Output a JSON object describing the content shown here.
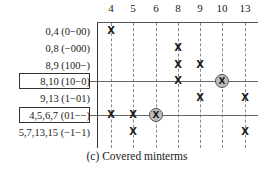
{
  "columns": [
    {
      "label": "4",
      "x": 111
    },
    {
      "label": "5",
      "x": 133
    },
    {
      "label": "6",
      "x": 156
    },
    {
      "label": "8",
      "x": 178
    },
    {
      "label": "9",
      "x": 200
    },
    {
      "label": "10",
      "x": 222
    },
    {
      "label": "13",
      "x": 245
    }
  ],
  "rows": [
    {
      "label": "0,4 (0−00)",
      "y": 31,
      "boxed": false
    },
    {
      "label": "0,8 (−000)",
      "y": 48,
      "boxed": false
    },
    {
      "label": "8,9 (100−)",
      "y": 65,
      "boxed": false
    },
    {
      "label": "8,10 (10−0)",
      "y": 81,
      "boxed": true
    },
    {
      "label": "9,13 (1−01)",
      "y": 98,
      "boxed": false
    },
    {
      "label": "4,5,6,7 (01−−)",
      "y": 115,
      "boxed": true
    },
    {
      "label": "5,7,13,15 (−1−1)",
      "y": 132,
      "boxed": false
    }
  ],
  "marks": [
    {
      "row": 0,
      "col": 0,
      "circled": false
    },
    {
      "row": 1,
      "col": 3,
      "circled": false
    },
    {
      "row": 2,
      "col": 3,
      "circled": false
    },
    {
      "row": 2,
      "col": 4,
      "circled": false
    },
    {
      "row": 3,
      "col": 3,
      "circled": false
    },
    {
      "row": 3,
      "col": 5,
      "circled": true
    },
    {
      "row": 4,
      "col": 4,
      "circled": false
    },
    {
      "row": 4,
      "col": 6,
      "circled": false
    },
    {
      "row": 5,
      "col": 0,
      "circled": false
    },
    {
      "row": 5,
      "col": 1,
      "circled": false
    },
    {
      "row": 5,
      "col": 2,
      "circled": true
    },
    {
      "row": 6,
      "col": 1,
      "circled": false
    },
    {
      "row": 6,
      "col": 6,
      "circled": false
    }
  ],
  "mark_symbol": "X",
  "caption": "(c) Covered minterms",
  "colors": {
    "circle_fill": "#bdbdbd",
    "line": "#333333"
  }
}
